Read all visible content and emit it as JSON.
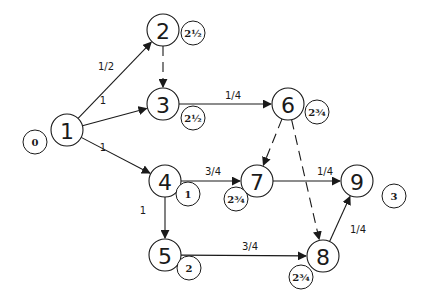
{
  "diagram": {
    "type": "activity network (critical path)",
    "start_time": {
      "value": "0",
      "x": 35,
      "y": 142
    },
    "nodes": [
      {
        "id": "1",
        "x": 67,
        "y": 130,
        "time": null
      },
      {
        "id": "2",
        "x": 163,
        "y": 30,
        "time": "2½",
        "tx": 193,
        "ty": 33
      },
      {
        "id": "3",
        "x": 163,
        "y": 104,
        "time": "2½",
        "tx": 193,
        "ty": 118
      },
      {
        "id": "4",
        "x": 165,
        "y": 181,
        "time": "1",
        "tx": 188,
        "ty": 194
      },
      {
        "id": "5",
        "x": 165,
        "y": 255,
        "time": "2",
        "tx": 189,
        "ty": 268
      },
      {
        "id": "6",
        "x": 288,
        "y": 104,
        "time": "2¾",
        "tx": 317,
        "ty": 112
      },
      {
        "id": "7",
        "x": 257,
        "y": 181,
        "time": "2¾",
        "tx": 236,
        "ty": 199
      },
      {
        "id": "8",
        "x": 323,
        "y": 256,
        "time": "2¾",
        "tx": 301,
        "ty": 277
      },
      {
        "id": "9",
        "x": 357,
        "y": 181,
        "time": "3",
        "tx": 394,
        "ty": 196
      }
    ],
    "edges": [
      {
        "from": "1",
        "to": "2",
        "label": "1/2",
        "dashed": false,
        "lx": 106,
        "ly": 70
      },
      {
        "from": "1",
        "to": "3",
        "label": "1",
        "dashed": false,
        "lx": 103,
        "ly": 104
      },
      {
        "from": "1",
        "to": "4",
        "label": "1",
        "dashed": false,
        "lx": 103,
        "ly": 151
      },
      {
        "from": "2",
        "to": "3",
        "label": "",
        "dashed": true
      },
      {
        "from": "3",
        "to": "6",
        "label": "1/4",
        "dashed": false,
        "lx": 233,
        "ly": 99
      },
      {
        "from": "4",
        "to": "7",
        "label": "3/4",
        "dashed": false,
        "lx": 213,
        "ly": 175
      },
      {
        "from": "4",
        "to": "5",
        "label": "1",
        "dashed": false,
        "lx": 143,
        "ly": 214
      },
      {
        "from": "6",
        "to": "7",
        "label": "",
        "dashed": true
      },
      {
        "from": "6",
        "to": "8",
        "label": "",
        "dashed": true
      },
      {
        "from": "7",
        "to": "9",
        "label": "1/4",
        "dashed": false,
        "lx": 325,
        "ly": 175
      },
      {
        "from": "5",
        "to": "8",
        "label": "3/4",
        "dashed": false,
        "lx": 250,
        "ly": 250
      },
      {
        "from": "8",
        "to": "9",
        "label": "1/4",
        "dashed": false,
        "lx": 358,
        "ly": 233
      }
    ],
    "colors": {
      "line": "#1a1a1a",
      "background": "#ffffff"
    }
  }
}
